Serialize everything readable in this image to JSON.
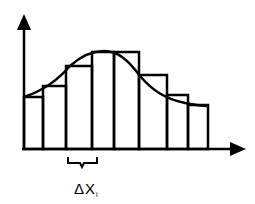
{
  "delta_label": "ΔX",
  "delta_subscript": "i",
  "colors": {
    "stroke": "#000000",
    "background": "#ffffff"
  },
  "rectangles": [
    {
      "x0": 24,
      "x1": 43,
      "top": 97
    },
    {
      "x0": 43,
      "x1": 66,
      "top": 86
    },
    {
      "x0": 66,
      "x1": 92,
      "top": 66
    },
    {
      "x0": 92,
      "x1": 114,
      "top": 52
    },
    {
      "x0": 114,
      "x1": 139,
      "top": 52
    },
    {
      "x0": 139,
      "x1": 167,
      "top": 75
    },
    {
      "x0": 167,
      "x1": 188,
      "top": 95
    },
    {
      "x0": 188,
      "x1": 208,
      "top": 105
    }
  ],
  "baseline_y": 149
}
